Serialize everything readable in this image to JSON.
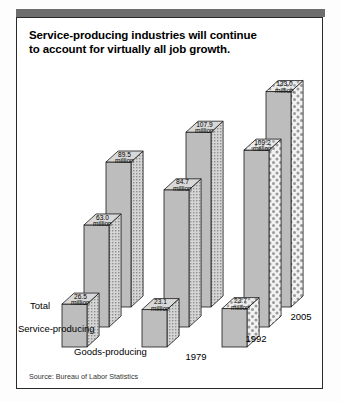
{
  "title": {
    "line1": "Service-producing industries will continue",
    "line2": "to account for virtually all job growth."
  },
  "source": "Source: Bureau of Labor Statistics",
  "row_labels": [
    "Total",
    "Service-producing",
    "Goods-producing"
  ],
  "year_labels": [
    "1979",
    "1992",
    "2005"
  ],
  "unit_label": "million",
  "chart_data": {
    "type": "bar",
    "title": "Service-producing industries will continue to account for virtually all job growth.",
    "subtitle": "",
    "xlabel": "",
    "ylabel": "",
    "unit": "million",
    "categories": [
      "1979",
      "1992",
      "2005"
    ],
    "series": [
      {
        "name": "Total",
        "values": [
          89.5,
          107.9,
          133.0
        ],
        "labels": [
          "89.5",
          "107.9",
          "133.0"
        ]
      },
      {
        "name": "Service-producing",
        "values": [
          63.0,
          84.7,
          109.2
        ],
        "labels": [
          "63.0",
          "84.7",
          "109.2"
        ]
      },
      {
        "name": "Goods-producing",
        "values": [
          26.5,
          23.1,
          23.7
        ],
        "labels": [
          "26.5",
          "23.1",
          "23.7"
        ]
      }
    ],
    "ylim": [
      0,
      133.0
    ],
    "grid": false,
    "legend": "none",
    "style": "3d-isometric-blocks",
    "annotation": "Source: Bureau of Labor Statistics"
  },
  "colors": {
    "bar_top": "#d8d8d8",
    "bar_left": "#bdbdbd",
    "bar_right_hatch": "#cfcfcf",
    "outline": "#1a1a1a",
    "header_band": "#6d6d6d",
    "frame": "#2a2a2a",
    "text": "#000000"
  }
}
